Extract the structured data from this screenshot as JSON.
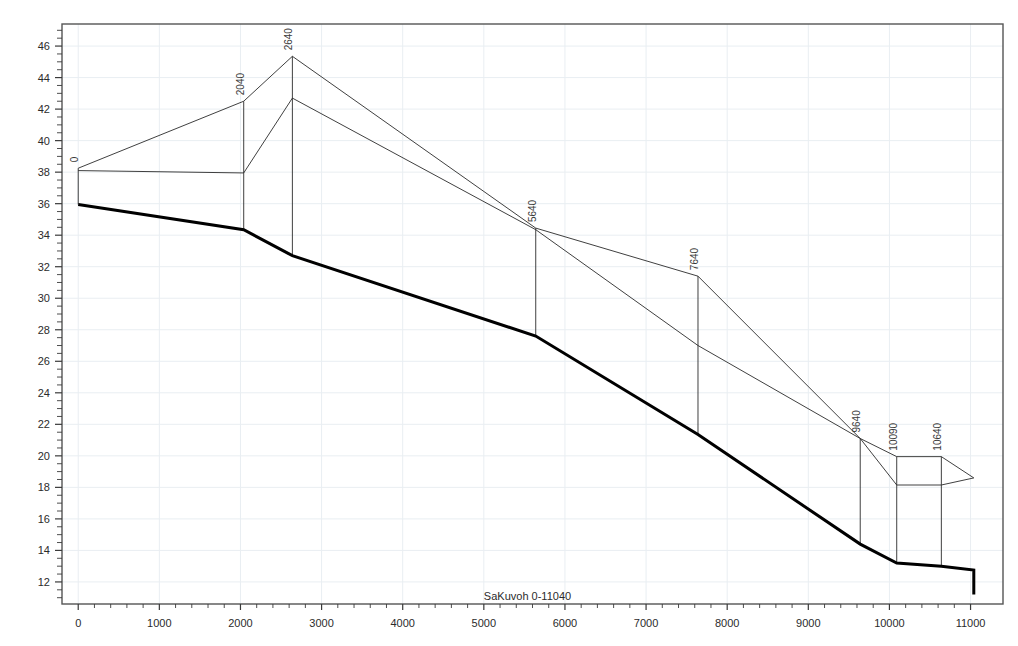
{
  "chart_data": {
    "type": "line",
    "title": "",
    "subtitle": "",
    "xlabel": "SaKuvoh 0-11040",
    "ylabel": "",
    "xlim": [
      -200,
      11400
    ],
    "ylim": [
      10.6,
      47.4
    ],
    "xticks": [
      0,
      1000,
      2000,
      3000,
      4000,
      5000,
      6000,
      7000,
      8000,
      9000,
      10000,
      11000
    ],
    "xtick_labels": [
      "0",
      "1000",
      "2000",
      "3000",
      "4000",
      "5000",
      "6000",
      "7000",
      "8000",
      "9000",
      "10000",
      "11000"
    ],
    "yticks": [
      12,
      14,
      16,
      18,
      20,
      22,
      24,
      26,
      28,
      30,
      32,
      34,
      36,
      38,
      40,
      42,
      44,
      46
    ],
    "ytick_labels": [
      "12",
      "14",
      "16",
      "18",
      "20",
      "22",
      "24",
      "26",
      "28",
      "30",
      "32",
      "34",
      "36",
      "38",
      "40",
      "42",
      "44",
      "46"
    ],
    "grid": true,
    "legend": "none",
    "minor_ticks": true,
    "series": [
      {
        "name": "upper-profile-a",
        "style": "thin",
        "color": "#2a2a2a",
        "width": 0.9,
        "points": [
          {
            "x": 0,
            "y": 38.25
          },
          {
            "x": 2040,
            "y": 42.5
          },
          {
            "x": 2640,
            "y": 45.35
          },
          {
            "x": 5640,
            "y": 34.45
          },
          {
            "x": 7640,
            "y": 31.4
          },
          {
            "x": 9640,
            "y": 21.1
          },
          {
            "x": 10090,
            "y": 19.95
          },
          {
            "x": 10640,
            "y": 19.95
          },
          {
            "x": 11040,
            "y": 18.6
          }
        ]
      },
      {
        "name": "upper-profile-b",
        "style": "thin",
        "color": "#2a2a2a",
        "width": 0.9,
        "points": [
          {
            "x": 0,
            "y": 38.1
          },
          {
            "x": 2040,
            "y": 37.95
          },
          {
            "x": 2640,
            "y": 42.7
          },
          {
            "x": 5640,
            "y": 34.35
          },
          {
            "x": 7640,
            "y": 27.0
          },
          {
            "x": 9640,
            "y": 21.1
          },
          {
            "x": 10090,
            "y": 18.15
          },
          {
            "x": 10640,
            "y": 18.15
          },
          {
            "x": 11040,
            "y": 18.6
          }
        ]
      },
      {
        "name": "ground-profile",
        "style": "thick",
        "color": "#000000",
        "width": 3.0,
        "points": [
          {
            "x": 0,
            "y": 35.95
          },
          {
            "x": 2040,
            "y": 34.35
          },
          {
            "x": 2640,
            "y": 32.7
          },
          {
            "x": 5640,
            "y": 27.6
          },
          {
            "x": 7640,
            "y": 21.35
          },
          {
            "x": 9640,
            "y": 14.4
          },
          {
            "x": 10090,
            "y": 13.2
          },
          {
            "x": 10640,
            "y": 13.0
          },
          {
            "x": 11040,
            "y": 12.75
          },
          {
            "x": 11040,
            "y": 11.2
          }
        ]
      }
    ],
    "stations": [
      {
        "label": "0",
        "x": 0,
        "y_top": 38.25,
        "y_bottom": 35.95
      },
      {
        "label": "2040",
        "x": 2040,
        "y_top": 42.5,
        "y_bottom": 34.35
      },
      {
        "label": "2640",
        "x": 2640,
        "y_top": 45.35,
        "y_bottom": 32.7
      },
      {
        "label": "5640",
        "x": 5640,
        "y_top": 34.45,
        "y_bottom": 27.6
      },
      {
        "label": "7640",
        "x": 7640,
        "y_top": 31.4,
        "y_bottom": 21.35
      },
      {
        "label": "9640",
        "x": 9640,
        "y_top": 21.1,
        "y_bottom": 14.4
      },
      {
        "label": "10090",
        "x": 10090,
        "y_top": 19.95,
        "y_bottom": 13.2
      },
      {
        "label": "10640",
        "x": 10640,
        "y_top": 19.95,
        "y_bottom": 13.0
      }
    ],
    "colors": {
      "frame": "#555555",
      "grid": "#e9eef2",
      "tick": "#3a3a3a",
      "thin_line": "#2a2a2a",
      "thick_line": "#000000",
      "background": "#ffffff"
    }
  }
}
